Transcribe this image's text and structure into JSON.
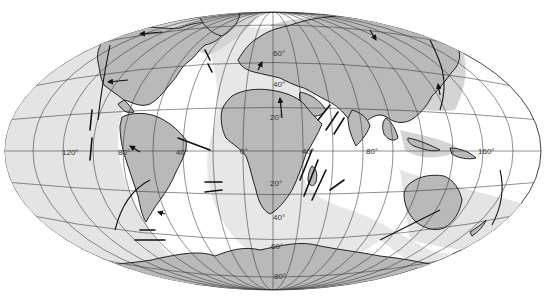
{
  "map": {
    "projection": "elliptical equal-area world projection",
    "colors": {
      "land": "#b9b9b9",
      "ocean": "#ffffff",
      "ridge_zone": "#e4e4e4",
      "graticule": "#333333",
      "boundaries": "#111111"
    },
    "longitude_labels": [
      {
        "text": "120°",
        "x": 62,
        "y": 155
      },
      {
        "text": "80°",
        "x": 124,
        "y": 155
      },
      {
        "text": "40°",
        "x": 181,
        "y": 155
      },
      {
        "text": "0°",
        "x": 243,
        "y": 153
      },
      {
        "text": "40°",
        "x": 306,
        "y": 153
      },
      {
        "text": "80°",
        "x": 368,
        "y": 153
      },
      {
        "text": "160°",
        "x": 482,
        "y": 153
      }
    ],
    "latitude_labels": [
      {
        "text": "60°",
        "x": 274,
        "y": 56
      },
      {
        "text": "40°",
        "x": 278,
        "y": 87
      },
      {
        "text": "20°",
        "x": 273,
        "y": 120
      },
      {
        "text": "20°",
        "x": 273,
        "y": 187
      },
      {
        "text": "40°",
        "x": 276,
        "y": 220
      },
      {
        "text": "60°",
        "x": 274,
        "y": 249
      },
      {
        "text": "80°",
        "x": 277,
        "y": 280
      }
    ]
  }
}
